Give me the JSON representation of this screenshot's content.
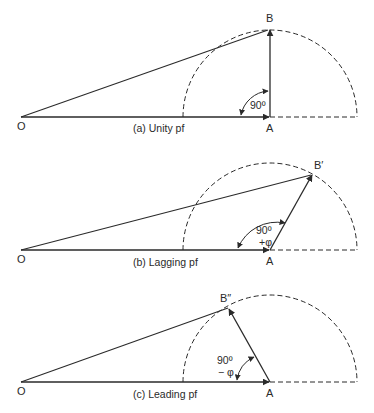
{
  "colors": {
    "line": "#2a2a2a",
    "background": "#ffffff"
  },
  "panels": [
    {
      "id": "a",
      "caption": "(a) Unity pf",
      "points": {
        "O": "O",
        "A": "A",
        "B": "B"
      },
      "angle_label": "90º",
      "angle_sub": ""
    },
    {
      "id": "b",
      "caption": "(b) Lagging pf",
      "points": {
        "O": "O",
        "A": "A",
        "B": "B′"
      },
      "angle_label": "90º",
      "angle_sub": "+φ"
    },
    {
      "id": "c",
      "caption": "(c) Leading pf",
      "points": {
        "O": "O",
        "A": "A",
        "B": "B″"
      },
      "angle_label": "90º",
      "angle_sub": "− φ"
    }
  ]
}
